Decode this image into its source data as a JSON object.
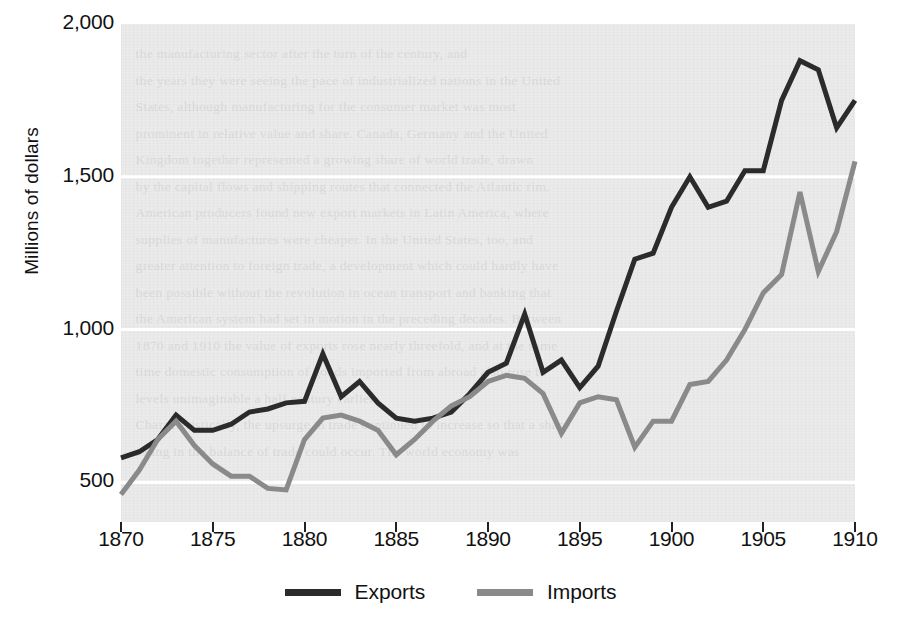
{
  "chart_data": {
    "type": "line",
    "title": "",
    "xlabel": "",
    "ylabel": "Millions of dollars",
    "xlim": [
      1870,
      1910
    ],
    "ylim": [
      370,
      2000
    ],
    "ytick_values": [
      500,
      1000,
      1500,
      2000
    ],
    "ytick_labels": [
      "500",
      "1,000",
      "1,500",
      "2,000"
    ],
    "xtick_values": [
      1870,
      1875,
      1880,
      1885,
      1890,
      1895,
      1900,
      1905,
      1910
    ],
    "xtick_labels": [
      "1870",
      "1875",
      "1880",
      "1885",
      "1890",
      "1895",
      "1900",
      "1905",
      "1910"
    ],
    "grid": "horizontal-white-gridlines-on-gray-panel",
    "legend_position": "bottom-center",
    "x": [
      1870,
      1871,
      1872,
      1873,
      1874,
      1875,
      1876,
      1877,
      1878,
      1879,
      1880,
      1881,
      1882,
      1883,
      1884,
      1885,
      1886,
      1887,
      1888,
      1889,
      1890,
      1891,
      1892,
      1893,
      1894,
      1895,
      1896,
      1897,
      1898,
      1899,
      1900,
      1901,
      1902,
      1903,
      1904,
      1905,
      1906,
      1907,
      1908,
      1909,
      1910
    ],
    "series": [
      {
        "name": "Exports",
        "color": "#2b2b2b",
        "values": [
          580,
          600,
          640,
          720,
          670,
          670,
          690,
          730,
          740,
          760,
          765,
          920,
          780,
          830,
          760,
          710,
          700,
          710,
          730,
          790,
          860,
          890,
          1050,
          860,
          900,
          810,
          880,
          1060,
          1230,
          1250,
          1400,
          1500,
          1400,
          1420,
          1520,
          1520,
          1750,
          1880,
          1850,
          1660,
          1750
        ]
      },
      {
        "name": "Imports",
        "color": "#8a8a8a",
        "values": [
          460,
          540,
          640,
          700,
          620,
          560,
          520,
          520,
          480,
          475,
          640,
          710,
          720,
          700,
          670,
          590,
          640,
          700,
          750,
          780,
          830,
          850,
          840,
          790,
          660,
          760,
          780,
          770,
          615,
          700,
          700,
          820,
          830,
          900,
          1000,
          1120,
          1180,
          1450,
          1190,
          1320,
          1550
        ]
      }
    ]
  },
  "legend": {
    "items": [
      {
        "label": "Exports",
        "color": "#2b2b2b"
      },
      {
        "label": "Imports",
        "color": "#8a8a8a"
      }
    ]
  },
  "background_text": {
    "lines": [
      "the manufacturing sector after the turn of the century, and",
      "the years they were seeing the pace of industrialized nations in the United",
      "States, although manufacturing for the consumer market was most",
      "prominent in relative value and share. Canada, Germany and the United",
      "Kingdom together represented a growing share of world trade, drawn",
      "by the capital flows and shipping routes that connected the Atlantic rim.",
      "American producers found new export markets in Latin America, where",
      "supplies of manufactures were cheaper. In the United States, too, and",
      "greater attention to foreign trade, a development which could hardly have",
      "been possible without the revolution in ocean transport and banking that",
      "the American system had set in motion in the preceding decades. Between",
      "1870 and 1910 the value of exports rose nearly threefold, and at the same",
      "time domestic consumption of goods imported from abroad also rose to",
      "levels unimaginable a half century earlier.",
      "Characteristically, the upsurge in trade continued to increase so that a sharp",
      "swing in the balance of trade could occur. The world economy was"
    ]
  }
}
